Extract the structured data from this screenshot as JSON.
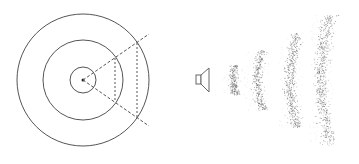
{
  "figure": {
    "left_panel": {
      "description": "Concentric circles with a dashed wedge from the center",
      "circle_count": 3,
      "wedge_line_count": 2,
      "dashed_chord_count": 2
    },
    "right_panel": {
      "description": "Loudspeaker emitting stippled sound wavefronts",
      "source_icon": "speaker-icon",
      "wavefront_count": 4
    },
    "colors": {
      "stroke": "#555555",
      "stipple": "#666666",
      "background": "#ffffff"
    }
  }
}
